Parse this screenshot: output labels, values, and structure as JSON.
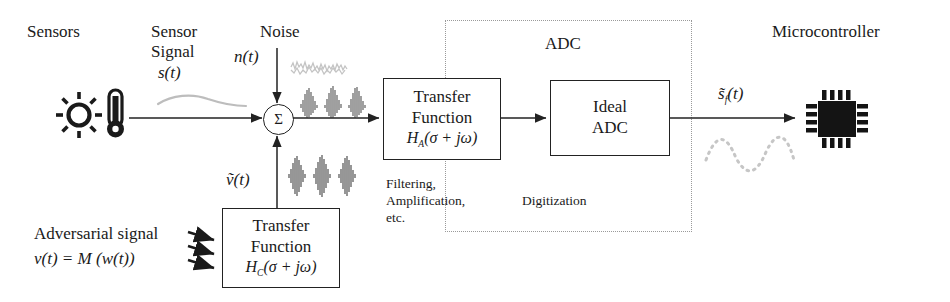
{
  "diagram": {
    "headers": {
      "sensors": "Sensors",
      "sensor_signal_line1": "Sensor",
      "sensor_signal_line2": "Signal",
      "noise": "Noise",
      "adc": "ADC",
      "microcontroller": "Microcontroller"
    },
    "signals": {
      "sensor_signal_sym": "s(t)",
      "noise_sym": "n(t)",
      "adversarial_filtered_sym": "ṽ(t)",
      "output_sym": "s̃",
      "output_sub": "f",
      "output_tail": "(t)"
    },
    "summing_junction": {
      "glyph": "Σ",
      "name": "summation"
    },
    "blocks": {
      "analog_transfer": {
        "line1": "Transfer",
        "line2": "Function",
        "line3_head": "H",
        "line3_sub": "A",
        "line3_tail": "(σ + jω)"
      },
      "ideal_adc": {
        "line1": "Ideal",
        "line2": "ADC"
      },
      "coupling_transfer": {
        "line1": "Transfer",
        "line2": "Function",
        "line3_head": "H",
        "line3_sub": "C",
        "line3_tail": "(σ + jω)"
      }
    },
    "captions": {
      "analog_stage_line1": "Filtering,",
      "analog_stage_line2": "Amplification,",
      "analog_stage_line3": "etc.",
      "digital_stage": "Digitization"
    },
    "adversary": {
      "label_line1": "Adversarial signal",
      "label_line2_lhs": "v(t) = M",
      "label_line2_rhs": "(w(t))"
    },
    "icons": {
      "sun": "sun-icon",
      "thermometer": "thermometer-icon",
      "chip": "microcontroller-chip-icon",
      "waveform_noise": "noise-waveform-icon",
      "waveform_mixed": "mixed-burst-waveform-icon",
      "waveform_adversarial": "adversarial-burst-waveform-icon",
      "waveform_sampled": "sampled-waveform-icon",
      "waveform_sensor": "sensor-signal-curve-icon",
      "injection_arrows": "injection-arrows-icon"
    },
    "colors": {
      "ink": "#1a1a1a",
      "line": "#222222",
      "faint": "#b8b8b8",
      "dash": "#9a9a9a",
      "chip": "#141414"
    }
  }
}
